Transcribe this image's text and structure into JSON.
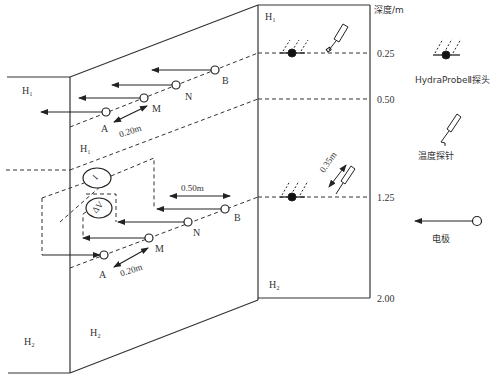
{
  "diagram": {
    "layers": {
      "h1_left_outer": "H₁",
      "h1_upper_slope": "H₁",
      "h1_profile": "H₁",
      "h2_left_outer": "H₂",
      "h2_slope": "H₂",
      "h2_profile": "H₂"
    },
    "electrode_array_upper": {
      "electrodes": [
        "A",
        "M",
        "N",
        "B"
      ],
      "spacing_label": "0.20m"
    },
    "electrode_array_lower": {
      "electrodes": [
        "A",
        "M",
        "N",
        "B"
      ],
      "spacing_label_am": "0.20m",
      "spacing_label_nb": "0.50m",
      "meter_current": "I",
      "meter_voltage": "ΔV"
    },
    "profile": {
      "depth_axis_title": "深度/m",
      "depth_ticks": [
        "0.25",
        "0.50",
        "1.25",
        "2.00"
      ],
      "probe_spacing_label": "0.35m"
    },
    "legend": {
      "items": [
        {
          "icon": "hydraprobe-icon",
          "label": "HydraProbeⅡ探头"
        },
        {
          "icon": "temperature-probe-icon",
          "label": "温度探针"
        },
        {
          "icon": "electrode-icon",
          "label": "电极"
        }
      ]
    }
  }
}
